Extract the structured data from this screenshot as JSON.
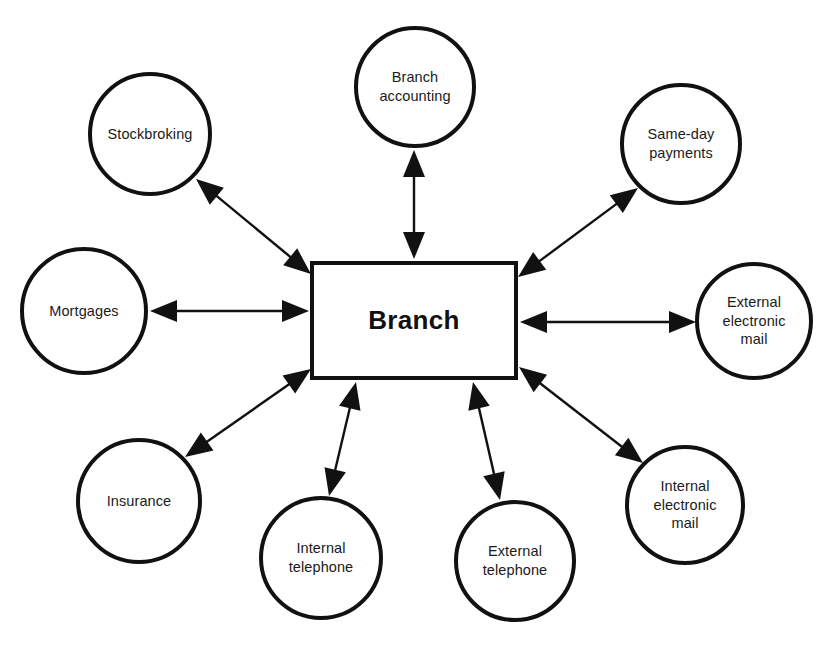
{
  "diagram": {
    "type": "hub-and-spoke",
    "center": {
      "id": "branch",
      "label": "Branch",
      "shape": "rectangle",
      "x": 310,
      "y": 261,
      "w": 208,
      "h": 119
    },
    "colors": {
      "stroke": "#111111",
      "fill": "#ffffff",
      "text": "#1a1a1a"
    },
    "nodes": [
      {
        "id": "branch-accounting",
        "label": "Branch\naccounting",
        "shape": "circle",
        "cx": 415,
        "cy": 87,
        "r": 61
      },
      {
        "id": "stockbroking",
        "label": "Stockbroking",
        "shape": "circle",
        "cx": 150,
        "cy": 134,
        "r": 62
      },
      {
        "id": "same-day-payments",
        "label": "Same-day\npayments",
        "shape": "circle",
        "cx": 681,
        "cy": 144,
        "r": 61
      },
      {
        "id": "mortgages",
        "label": "Mortgages",
        "shape": "circle",
        "cx": 84,
        "cy": 311,
        "r": 64
      },
      {
        "id": "external-electronic-mail",
        "label": "External\nelectronic\nmail",
        "shape": "circle",
        "cx": 754,
        "cy": 321,
        "r": 59
      },
      {
        "id": "insurance",
        "label": "Insurance",
        "shape": "circle",
        "cx": 139,
        "cy": 501,
        "r": 63
      },
      {
        "id": "internal-electronic-mail",
        "label": "Internal\nelectronic\nmail",
        "shape": "circle",
        "cx": 685,
        "cy": 505,
        "r": 60
      },
      {
        "id": "internal-telephone",
        "label": "Internal\ntelephone",
        "shape": "circle",
        "cx": 321,
        "cy": 558,
        "r": 62
      },
      {
        "id": "external-telephone",
        "label": "External\ntelephone",
        "shape": "circle",
        "cx": 515,
        "cy": 561,
        "r": 61
      }
    ],
    "edges": [
      {
        "id": "edge-branch-accounting",
        "from": "branch",
        "to": "branch-accounting",
        "direction": "both",
        "x1": 414,
        "y1": 259,
        "x2": 414,
        "y2": 150
      },
      {
        "id": "edge-stockbroking",
        "from": "branch",
        "to": "stockbroking",
        "direction": "both",
        "x1": 311,
        "y1": 274,
        "x2": 196,
        "y2": 179
      },
      {
        "id": "edge-same-day-payments",
        "from": "branch",
        "to": "same-day-payments",
        "direction": "both",
        "x1": 518,
        "y1": 277,
        "x2": 638,
        "y2": 188
      },
      {
        "id": "edge-mortgages",
        "from": "branch",
        "to": "mortgages",
        "direction": "both",
        "x1": 309,
        "y1": 311,
        "x2": 150,
        "y2": 311
      },
      {
        "id": "edge-external-electronic-mail",
        "from": "branch",
        "to": "external-electronic-mail",
        "direction": "both",
        "x1": 520,
        "y1": 322,
        "x2": 696,
        "y2": 322
      },
      {
        "id": "edge-insurance",
        "from": "branch",
        "to": "insurance",
        "direction": "both",
        "x1": 311,
        "y1": 369,
        "x2": 185,
        "y2": 457
      },
      {
        "id": "edge-internal-electronic-mail",
        "from": "branch",
        "to": "internal-electronic-mail",
        "direction": "both",
        "x1": 519,
        "y1": 367,
        "x2": 643,
        "y2": 463
      },
      {
        "id": "edge-internal-telephone",
        "from": "branch",
        "to": "internal-telephone",
        "direction": "both",
        "x1": 356,
        "y1": 382,
        "x2": 329,
        "y2": 496
      },
      {
        "id": "edge-external-telephone",
        "from": "branch",
        "to": "external-telephone",
        "direction": "both",
        "x1": 473,
        "y1": 382,
        "x2": 500,
        "y2": 500
      }
    ]
  }
}
